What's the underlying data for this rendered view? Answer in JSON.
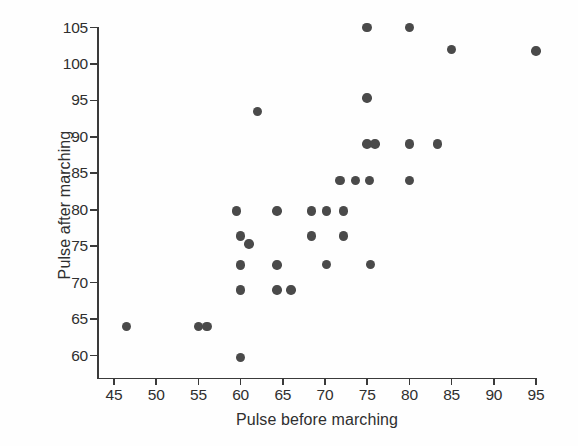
{
  "chart_data": {
    "type": "scatter",
    "title": "",
    "xlabel": "Pulse before marching",
    "ylabel": "Pulse after marching",
    "xlim": [
      43,
      97
    ],
    "ylim": [
      58,
      106.5
    ],
    "xticks": [
      45,
      50,
      55,
      60,
      65,
      70,
      75,
      80,
      85,
      90,
      95
    ],
    "yticks": [
      60,
      65,
      70,
      75,
      80,
      85,
      90,
      95,
      100,
      105
    ],
    "grid": false,
    "legend": null,
    "marker": {
      "shape": "circle",
      "color": "#4a4a4a",
      "size": 9.5
    },
    "points": [
      {
        "x": 46.5,
        "y": 64.0
      },
      {
        "x": 55.0,
        "y": 64.0
      },
      {
        "x": 56.0,
        "y": 64.0
      },
      {
        "x": 59.5,
        "y": 79.8
      },
      {
        "x": 60.0,
        "y": 76.4
      },
      {
        "x": 61.0,
        "y": 75.3
      },
      {
        "x": 60.0,
        "y": 72.4
      },
      {
        "x": 60.0,
        "y": 69.0
      },
      {
        "x": 60.0,
        "y": 59.7
      },
      {
        "x": 62.0,
        "y": 93.5
      },
      {
        "x": 64.3,
        "y": 79.8
      },
      {
        "x": 64.3,
        "y": 72.4
      },
      {
        "x": 64.3,
        "y": 69.0
      },
      {
        "x": 66.0,
        "y": 69.0
      },
      {
        "x": 68.4,
        "y": 79.8
      },
      {
        "x": 68.4,
        "y": 76.4
      },
      {
        "x": 70.2,
        "y": 79.8
      },
      {
        "x": 70.2,
        "y": 72.5
      },
      {
        "x": 72.2,
        "y": 79.8
      },
      {
        "x": 72.2,
        "y": 76.4
      },
      {
        "x": 71.8,
        "y": 84.0
      },
      {
        "x": 73.6,
        "y": 84.0
      },
      {
        "x": 75.3,
        "y": 84.0
      },
      {
        "x": 75.0,
        "y": 89.0
      },
      {
        "x": 75.9,
        "y": 89.0
      },
      {
        "x": 75.0,
        "y": 95.3
      },
      {
        "x": 75.0,
        "y": 105.0
      },
      {
        "x": 75.4,
        "y": 72.5
      },
      {
        "x": 80.0,
        "y": 105.0
      },
      {
        "x": 80.0,
        "y": 89.0
      },
      {
        "x": 80.0,
        "y": 84.0
      },
      {
        "x": 83.3,
        "y": 89.0
      },
      {
        "x": 85.0,
        "y": 102.0
      },
      {
        "x": 95.0,
        "y": 101.8
      }
    ]
  },
  "axis": {
    "x_title": "Pulse before marching",
    "y_title": "Pulse after marching"
  }
}
